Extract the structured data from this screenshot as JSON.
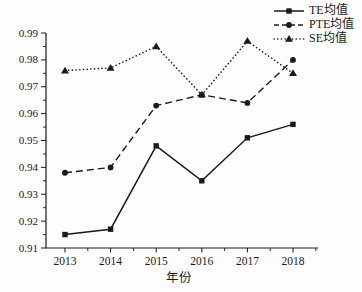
{
  "chart_data": {
    "type": "line",
    "title": "",
    "xlabel": "年份",
    "ylabel": "",
    "x": [
      "2013",
      "2014",
      "2015",
      "2016",
      "2017",
      "2018"
    ],
    "ylim": [
      0.91,
      0.99
    ],
    "ytick_step": 0.01,
    "y_minor_step": 0.005,
    "x_minor_ticks": true,
    "grid": false,
    "legend_position": "top-right",
    "axis_color": "#1a1a1a",
    "background_color": "#fdfdfd",
    "series": [
      {
        "id": "te",
        "name": "TE均值",
        "line_style": "solid",
        "marker": "square",
        "color": "#1a1a1a",
        "values": [
          0.915,
          0.917,
          0.948,
          0.935,
          0.951,
          0.956
        ]
      },
      {
        "id": "pte",
        "name": "PTE均值",
        "line_style": "dashed",
        "marker": "circle",
        "color": "#1a1a1a",
        "values": [
          0.938,
          0.94,
          0.963,
          0.967,
          0.964,
          0.98
        ]
      },
      {
        "id": "se",
        "name": "SE均值",
        "line_style": "dotted",
        "marker": "triangle",
        "color": "#1a1a1a",
        "values": [
          0.976,
          0.977,
          0.985,
          0.967,
          0.987,
          0.975
        ]
      }
    ]
  }
}
